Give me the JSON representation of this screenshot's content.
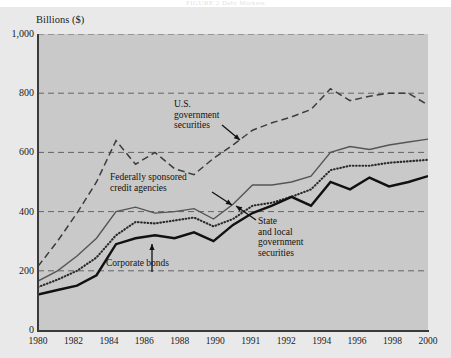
{
  "figure": {
    "top_caption": "FIGURE 2  Debt Markets",
    "y_axis_title": "Billions ($)"
  },
  "annotations": {
    "us_government_securities": "U.S.\ngovernment\nsecurities",
    "federally_sponsored_credit_agencies": "Federally sponsored\ncredit agencies",
    "state_and_local_government_securities": "State\nand local\ngovernment\nsecurities",
    "corporate_bonds": "Corporate bonds"
  },
  "colors": {
    "plot_background": "#c9c9c9",
    "panel_background": "#e9e9e9",
    "axis": "#3a3a3a",
    "gridline": "#4a4a4a",
    "us_government_securities": "#3d3d3d",
    "federally_sponsored_credit_agencies": "#555555",
    "state_and_local_government_securities": "#2a2a2a",
    "corporate_bonds": "#111111"
  },
  "chart_data": {
    "type": "line",
    "title": "FIGURE 2  Debt Markets",
    "xlabel": "",
    "ylabel": "Billions ($)",
    "ylim": [
      0,
      1000
    ],
    "yticks": [
      0,
      200,
      400,
      600,
      800,
      1000
    ],
    "ytick_labels": [
      "0",
      "200",
      "400",
      "600",
      "800",
      "1,000"
    ],
    "grid": true,
    "grid_axis": "y",
    "legend": "inline-annotations",
    "x": [
      1980,
      1981,
      1982,
      1983,
      1984,
      1985,
      1986,
      1987,
      1988,
      1989,
      1990,
      1991,
      1992,
      1993,
      1994,
      1995,
      1996,
      1997,
      1998,
      1999,
      2000
    ],
    "xtick_labels": [
      "1980",
      "1982",
      "1984",
      "1986",
      "1988",
      "1990",
      "1991",
      "1992",
      "1994",
      "1996",
      "1998",
      "2000"
    ],
    "xticks": [
      1980,
      1982,
      1984,
      1986,
      1988,
      1990,
      1991,
      1992,
      1994,
      1996,
      1998,
      2000
    ],
    "series": [
      {
        "name": "U.S. government securities",
        "style": "dashed",
        "values": [
          215,
          300,
          395,
          500,
          640,
          560,
          600,
          545,
          525,
          580,
          625,
          675,
          700,
          720,
          745,
          815,
          775,
          790,
          800,
          800,
          760
        ]
      },
      {
        "name": "Federally sponsored credit agencies",
        "style": "solid-thin",
        "values": [
          165,
          200,
          250,
          310,
          400,
          415,
          395,
          400,
          410,
          375,
          425,
          490,
          490,
          500,
          520,
          600,
          620,
          610,
          625,
          635,
          645
        ]
      },
      {
        "name": "State and local government securities",
        "style": "dotted",
        "values": [
          145,
          170,
          200,
          245,
          320,
          365,
          360,
          370,
          380,
          350,
          375,
          420,
          430,
          450,
          475,
          540,
          555,
          555,
          565,
          570,
          575
        ]
      },
      {
        "name": "Corporate bonds",
        "style": "solid-thick",
        "values": [
          120,
          135,
          150,
          185,
          290,
          310,
          320,
          310,
          330,
          300,
          355,
          395,
          420,
          450,
          420,
          500,
          475,
          515,
          485,
          500,
          520
        ]
      }
    ]
  }
}
